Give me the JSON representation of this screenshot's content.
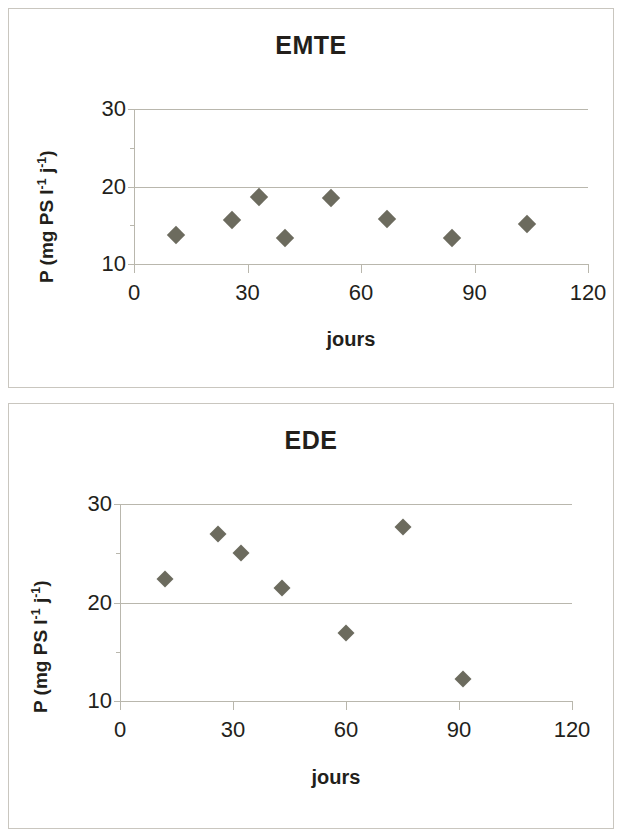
{
  "charts": [
    {
      "id": "emte",
      "title": "EMTE",
      "xlabel": "jours",
      "ylabel_html": "P (mg PS l<sup>-1</sup> j<sup>-1</sup>)",
      "ylabel_text": "P (mg PS l-1 j-1)",
      "xticks": [
        "0",
        "30",
        "60",
        "90",
        "120"
      ],
      "yticks": [
        "30",
        "20",
        "10"
      ]
    },
    {
      "id": "ede",
      "title": "EDE",
      "xlabel": "jours",
      "ylabel_html": "P (mg PS l<sup>-1</sup> j<sup>-1</sup>)",
      "ylabel_text": "P (mg PS l-1 j-1)",
      "xticks": [
        "0",
        "30",
        "60",
        "90",
        "120"
      ],
      "yticks": [
        "30",
        "20",
        "10"
      ]
    }
  ],
  "colors": {
    "marker": "#6c6b5e",
    "gridline": "#b9b7ad",
    "frame": "#c9c6bf",
    "text": "#231f1b",
    "background": "#ffffff"
  },
  "chart_data": [
    {
      "type": "scatter",
      "title": "EMTE",
      "xlabel": "jours",
      "ylabel": "P (mg PS l-1 j-1)",
      "xlim": [
        0,
        120
      ],
      "ylim": [
        10,
        30
      ],
      "xticks": [
        0,
        30,
        60,
        90,
        120
      ],
      "yticks": [
        10,
        20,
        30
      ],
      "grid": "horizontal",
      "legend": "none",
      "series": [
        {
          "name": "EMTE",
          "marker": "diamond",
          "color": "#6c6b5e",
          "points": [
            {
              "x": 11,
              "y": 13.7
            },
            {
              "x": 26,
              "y": 15.7
            },
            {
              "x": 33,
              "y": 18.6
            },
            {
              "x": 40,
              "y": 13.3
            },
            {
              "x": 52,
              "y": 18.5
            },
            {
              "x": 67,
              "y": 15.8
            },
            {
              "x": 84,
              "y": 13.4
            },
            {
              "x": 104,
              "y": 15.2
            }
          ]
        }
      ]
    },
    {
      "type": "scatter",
      "title": "EDE",
      "xlabel": "jours",
      "ylabel": "P (mg PS l-1 j-1)",
      "xlim": [
        0,
        120
      ],
      "ylim": [
        10,
        30
      ],
      "xticks": [
        0,
        30,
        60,
        90,
        120
      ],
      "yticks": [
        10,
        20,
        30
      ],
      "grid": "horizontal",
      "legend": "none",
      "series": [
        {
          "name": "EDE",
          "marker": "diamond",
          "color": "#6c6b5e",
          "points": [
            {
              "x": 12,
              "y": 22.4
            },
            {
              "x": 26,
              "y": 27.0
            },
            {
              "x": 32,
              "y": 25.0
            },
            {
              "x": 43,
              "y": 21.5
            },
            {
              "x": 60,
              "y": 16.9
            },
            {
              "x": 75,
              "y": 27.7
            },
            {
              "x": 91,
              "y": 12.2
            }
          ]
        }
      ]
    }
  ]
}
